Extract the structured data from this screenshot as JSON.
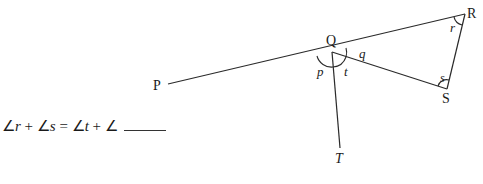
{
  "diagram": {
    "points": {
      "P": {
        "label": "P",
        "x": 166,
        "y": 85
      },
      "Q": {
        "label": "Q",
        "x": 332,
        "y": 52
      },
      "R": {
        "label": "R",
        "x": 465,
        "y": 14
      },
      "S": {
        "label": "S",
        "x": 447,
        "y": 89
      },
      "T": {
        "label": "T",
        "x": 340,
        "y": 145
      }
    },
    "angle_labels": {
      "p": "p",
      "t": "t",
      "q": "q",
      "r": "r",
      "s": "s"
    }
  },
  "equation": {
    "part1": "∠",
    "r": "r",
    "plus1": " + ∠",
    "s": "s",
    "equals": " = ∠",
    "t": "t",
    "plus2": " + ∠"
  }
}
